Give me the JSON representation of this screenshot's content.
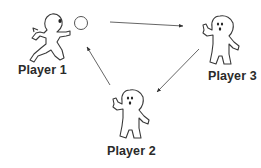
{
  "diagram": {
    "players": [
      {
        "id": "p1",
        "label": "Player 1",
        "pose": "running-throwing",
        "has_ball": true
      },
      {
        "id": "p2",
        "label": "Player 2",
        "pose": "waving"
      },
      {
        "id": "p3",
        "label": "Player 3",
        "pose": "waving"
      }
    ],
    "arrows": [
      {
        "from": "Player 1",
        "to": "Player 3"
      },
      {
        "from": "Player 3",
        "to": "Player 2"
      },
      {
        "from": "Player 2",
        "to": "Player 1"
      }
    ],
    "colors": {
      "stroke": "#3a3a3a",
      "arrow": "#555555",
      "label": "#2a2a2a",
      "background": "#ffffff"
    }
  }
}
